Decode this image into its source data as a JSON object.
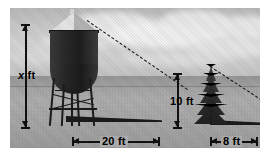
{
  "figure": {
    "scene_description": "Grayscale photograph of a water tower and a pine tree casting shadows on flat ground",
    "background_color": "#ffffff",
    "ink_color": "#111111"
  },
  "objects": {
    "tower": {
      "name": "water-tower",
      "icon": "water-tower-icon"
    },
    "tree": {
      "name": "pine-tree",
      "icon": "pine-tree-icon"
    },
    "tower_shadow": {
      "name": "tower-shadow"
    },
    "tree_shadow": {
      "name": "tree-shadow"
    },
    "sun_ray_tower": {
      "name": "dashed-hypotenuse-tower"
    },
    "sun_ray_tree": {
      "name": "dashed-hypotenuse-tree"
    }
  },
  "dimensions": [
    {
      "id": "x",
      "label_value": "x",
      "label_unit": "ft",
      "orientation": "vertical",
      "italic_value": true,
      "measures": "water tower height"
    },
    {
      "id": "ten",
      "label_value": "10",
      "label_unit": "ft",
      "orientation": "vertical",
      "italic_value": false,
      "measures": "tree height"
    },
    {
      "id": "twenty",
      "label_value": "20",
      "label_unit": "ft",
      "orientation": "horizontal",
      "italic_value": false,
      "measures": "tower shadow length"
    },
    {
      "id": "eight",
      "label_value": "8",
      "label_unit": "ft",
      "orientation": "horizontal",
      "italic_value": false,
      "measures": "tree shadow length"
    }
  ],
  "labels": {
    "x_ft": "x ft",
    "ten_ft": "10 ft",
    "twenty_ft": "20 ft",
    "eight_ft": "8 ft"
  },
  "chart_data": {
    "type": "diagram",
    "triangles": [
      {
        "name": "water tower",
        "height_label": "x ft",
        "height_value": null,
        "shadow_label": "20 ft",
        "shadow_value": 20,
        "unit": "ft"
      },
      {
        "name": "pine tree",
        "height_label": "10 ft",
        "height_value": 10,
        "shadow_label": "8 ft",
        "shadow_value": 8,
        "unit": "ft"
      }
    ],
    "unknown": "x",
    "relation": "x / 20 = 10 / 8"
  }
}
